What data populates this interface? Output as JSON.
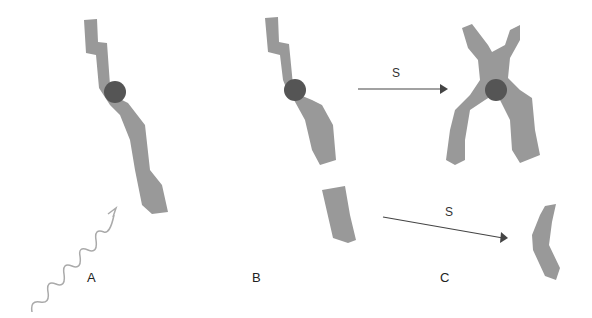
{
  "diagram": {
    "panels": [
      {
        "label": "A",
        "description": "Intact chromosome hit by radiation (wavy arrow)"
      },
      {
        "label": "B",
        "description": "Chromosome broken into centric fragment and acentric fragment"
      },
      {
        "label": "C",
        "description": "After S phase: replicated centric chromosome and acentric fragment"
      }
    ],
    "arrows": [
      {
        "label": "S",
        "from": "B centric fragment",
        "to": "C replicated chromosome"
      },
      {
        "label": "S",
        "from": "B acentric fragment",
        "to": "C acentric fragment"
      }
    ],
    "colors": {
      "chromosome": "#999999",
      "centromere": "#555555",
      "arrow": "#444444",
      "radiation": "#aaaaaa"
    }
  }
}
